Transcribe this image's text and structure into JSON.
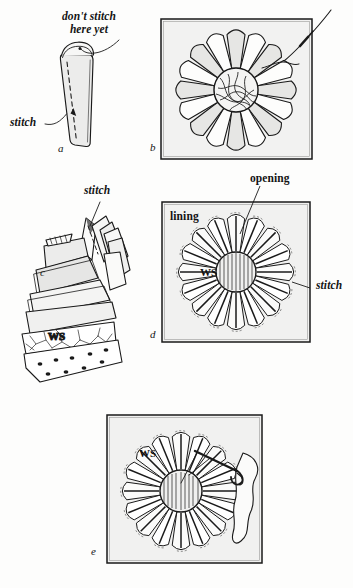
{
  "figure": {
    "background": "#fdfdfc",
    "ink": "#1a1a1a",
    "shade": "#e3e3e1",
    "panel_letters": [
      "a",
      "b",
      "c",
      "d",
      "e"
    ]
  },
  "panels": {
    "a": {
      "letter": "a",
      "labels": {
        "dont_stitch": "don't stitch\nhere yet",
        "stitch": "stitch"
      }
    },
    "b": {
      "letter": "b",
      "petal_count": 16,
      "has_needle": true,
      "has_frame": true
    },
    "c": {
      "letter": "c",
      "labels": {
        "stitch": "stitch",
        "ws": "WS"
      }
    },
    "d": {
      "letter": "d",
      "petal_count": 16,
      "has_frame": true,
      "labels": {
        "opening": "opening",
        "lining": "lining",
        "ws": "WS",
        "stitch": "stitch"
      }
    },
    "e": {
      "letter": "e",
      "petal_count": 16,
      "has_frame": true,
      "has_needle": true,
      "labels": {
        "ws": "WS"
      }
    }
  }
}
